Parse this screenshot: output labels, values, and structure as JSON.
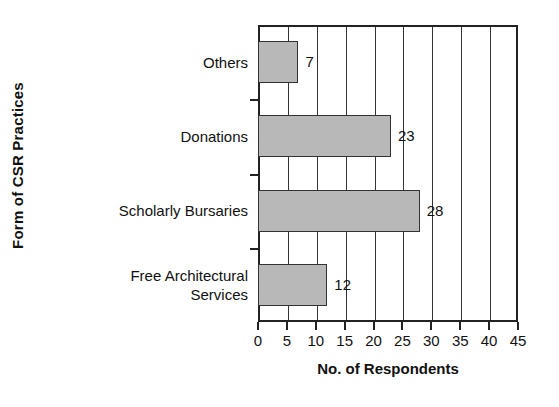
{
  "chart_data": {
    "type": "bar",
    "orientation": "horizontal",
    "title": "",
    "xlabel": "No. of Respondents",
    "ylabel": "Form of CSR Practices",
    "categories": [
      "Others",
      "Donations",
      "Scholarly Bursaries",
      "Free Architectural\nServices"
    ],
    "values": [
      7,
      23,
      28,
      12
    ],
    "value_labels": [
      "7",
      "23",
      "28",
      "12"
    ],
    "xlim": [
      0,
      45
    ],
    "xticks": [
      0,
      5,
      10,
      15,
      20,
      25,
      30,
      35,
      40,
      45
    ],
    "xtick_labels": [
      "0",
      "5",
      "10",
      "15",
      "20",
      "25",
      "30",
      "35",
      "40",
      "45"
    ],
    "grid": "vertical",
    "legend": "none",
    "bar_color": "#b8b8b8",
    "bar_border_color": "#333333",
    "axis_color": "#222222"
  }
}
